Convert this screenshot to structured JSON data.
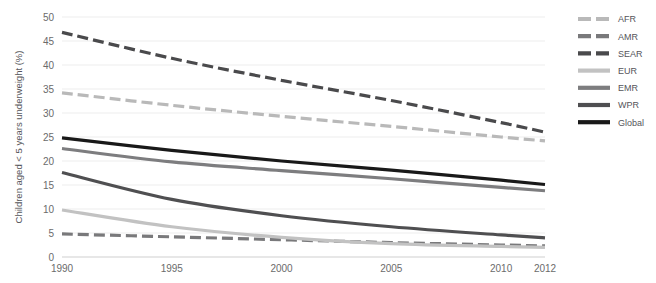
{
  "chart_data": {
    "type": "line",
    "title": "",
    "xlabel": "",
    "ylabel": "Children aged < 5 years underweight (%)",
    "xlim": [
      1990,
      2012
    ],
    "ylim": [
      0,
      50
    ],
    "x": [
      1990,
      1995,
      2000,
      2005,
      2010,
      2012
    ],
    "xtick_labels": [
      "1990",
      "1995",
      "2000",
      "2005",
      "2010",
      "2012"
    ],
    "ytick_labels": [
      "0",
      "5",
      "10",
      "15",
      "20",
      "25",
      "30",
      "35",
      "40",
      "45",
      "50"
    ],
    "yticks": [
      0,
      5,
      10,
      15,
      20,
      25,
      30,
      35,
      40,
      45,
      50
    ],
    "grid": "horizontal",
    "legend_position": "right",
    "series": [
      {
        "name": "AFR",
        "style": "dashed",
        "color": "#b9b9b9",
        "x": [
          1990,
          1995,
          2000,
          2005,
          2010,
          2012
        ],
        "values": [
          34.2,
          31.6,
          29.3,
          27.2,
          25.0,
          24.2
        ]
      },
      {
        "name": "AMR",
        "style": "dashed",
        "color": "#79797b",
        "x": [
          1990,
          1995,
          2000,
          2005,
          2010,
          2012
        ],
        "values": [
          4.8,
          4.2,
          3.6,
          3.0,
          2.5,
          2.3
        ]
      },
      {
        "name": "SEAR",
        "style": "dashed",
        "color": "#4a4a4c",
        "x": [
          1990,
          1995,
          2000,
          2005,
          2010,
          2012
        ],
        "values": [
          46.8,
          41.4,
          36.8,
          32.6,
          28.0,
          26.0
        ]
      },
      {
        "name": "EUR",
        "style": "solid",
        "color": "#c2c2c2",
        "x": [
          1990,
          1995,
          2000,
          2005,
          2010,
          2012
        ],
        "values": [
          9.8,
          6.3,
          4.1,
          2.8,
          2.2,
          2.0
        ]
      },
      {
        "name": "EMR",
        "style": "solid",
        "color": "#7d7d7f",
        "x": [
          1990,
          1995,
          2000,
          2005,
          2010,
          2012
        ],
        "values": [
          22.6,
          19.8,
          18.0,
          16.3,
          14.5,
          13.8
        ]
      },
      {
        "name": "WPR",
        "style": "solid",
        "color": "#4f4f51",
        "x": [
          1990,
          1995,
          2000,
          2005,
          2010,
          2012
        ],
        "values": [
          17.6,
          12.0,
          8.6,
          6.3,
          4.6,
          4.0
        ]
      },
      {
        "name": "Global",
        "style": "solid",
        "color": "#191919",
        "x": [
          1990,
          1995,
          2000,
          2005,
          2010,
          2012
        ],
        "values": [
          24.8,
          22.2,
          20.0,
          18.1,
          16.0,
          15.1
        ]
      }
    ]
  },
  "legend": {
    "entries": [
      {
        "label": "AFR"
      },
      {
        "label": "AMR"
      },
      {
        "label": "SEAR"
      },
      {
        "label": "EUR"
      },
      {
        "label": "EMR"
      },
      {
        "label": "WPR"
      },
      {
        "label": "Global"
      }
    ]
  },
  "colors": {
    "background": "#ffffff",
    "gridline": "#ededed",
    "axis": "#cfcfcf",
    "tick_text": "#6b6b6b",
    "legend_text": "#55555a"
  }
}
